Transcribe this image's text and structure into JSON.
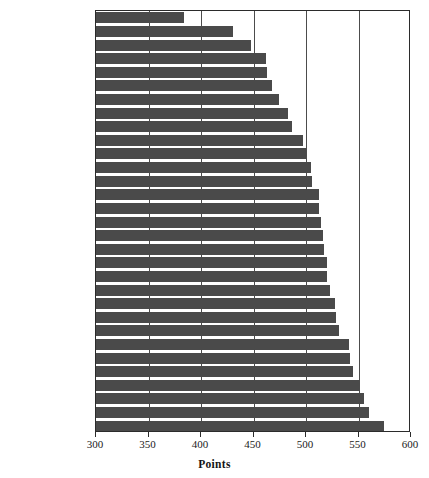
{
  "chart_data": {
    "type": "bar",
    "orientation": "horizontal",
    "title": "",
    "xlabel": "Points",
    "ylabel": "",
    "xlim": [
      300,
      600
    ],
    "xticks": [
      300,
      350,
      400,
      450,
      500,
      550,
      600
    ],
    "gridlines": [
      350,
      400,
      450,
      500,
      550
    ],
    "grid": true,
    "legend": null,
    "bar_color": "#4a4a4a",
    "axis_color": "#2b2b2b",
    "background": "#ffffff",
    "categories": [
      "Brazil",
      "Mexico",
      "Luxembourg",
      "Portugal",
      "Latvia",
      "Russia",
      "Greece",
      "Liechtenstein",
      "Italy",
      "Denmark",
      "Poland",
      "Germany",
      "Spain",
      "Switzerland",
      "Belgium",
      "Iceland",
      "Hungary",
      "USA",
      "Norway",
      "France",
      "Czech. Rep.",
      "Sweden",
      "Ireland",
      "Austria",
      "Australia",
      "New Zealand",
      "Canada",
      "U.K.",
      "Finland",
      "Japan",
      "Korea"
    ],
    "values": [
      384,
      430,
      448,
      462,
      463,
      468,
      474,
      483,
      487,
      497,
      500,
      505,
      506,
      512,
      512,
      514,
      516,
      517,
      520,
      520,
      523,
      528,
      529,
      531,
      541,
      542,
      545,
      551,
      555,
      560,
      574
    ]
  },
  "axis": {
    "tick_labels": [
      "300",
      "350",
      "400",
      "450",
      "500",
      "550",
      "600"
    ],
    "x_title": "Points"
  }
}
